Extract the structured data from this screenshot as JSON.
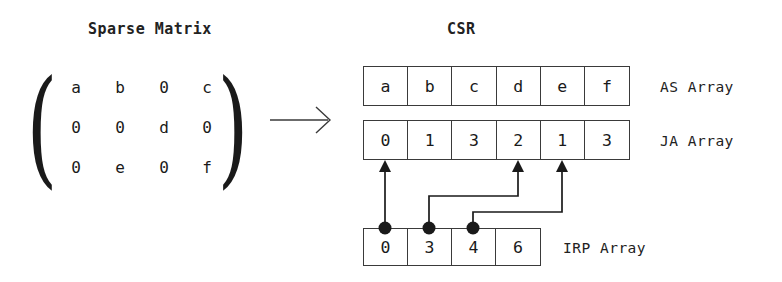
{
  "titles": {
    "left": "Sparse Matrix",
    "right": "CSR"
  },
  "matrix": {
    "rows": [
      [
        "a",
        "b",
        "0",
        "c"
      ],
      [
        "0",
        "0",
        "d",
        "0"
      ],
      [
        "0",
        "e",
        "0",
        "f"
      ]
    ],
    "open_paren": "(",
    "close_paren": ")"
  },
  "transform_arrow": "right-arrow",
  "arrays": [
    {
      "key": "as",
      "label": "AS Array",
      "values": [
        "a",
        "b",
        "c",
        "d",
        "e",
        "f"
      ]
    },
    {
      "key": "ja",
      "label": "JA Array",
      "values": [
        "0",
        "1",
        "3",
        "2",
        "1",
        "3"
      ]
    },
    {
      "key": "irp",
      "label": "IRP Array",
      "values": [
        "0",
        "3",
        "4",
        "6"
      ]
    }
  ],
  "connectors": {
    "description": "IRP entries point to start index of each row in JA/AS arrays",
    "links": [
      {
        "from_irp_index": 0,
        "to_ja_index": 0
      },
      {
        "from_irp_index": 1,
        "to_ja_index": 3
      },
      {
        "from_irp_index": 2,
        "to_ja_index": 4
      }
    ]
  },
  "colors": {
    "ink": "#1a1a1a",
    "stroke": "#3a3a3a",
    "background": "#ffffff"
  }
}
